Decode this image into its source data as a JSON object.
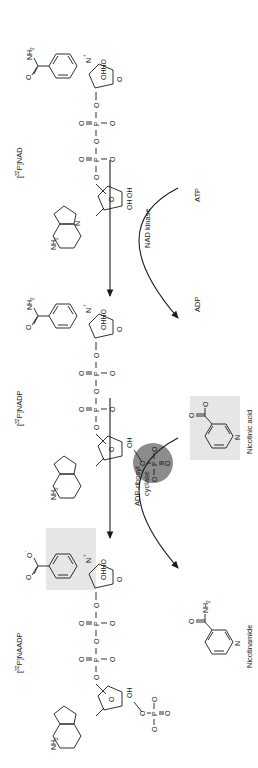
{
  "figure": {
    "orientation": "rotated-90-ccw",
    "colors": {
      "ink": "#1a1a1a",
      "highlight_box": "#e6e6e6",
      "phosphate_circle": "#8c8c8c",
      "background": "#ffffff"
    },
    "compounds": [
      {
        "id": "nad",
        "label_prefix": "[",
        "label_sup": "32",
        "label_suffix": "P]NAD"
      },
      {
        "id": "nadp",
        "label_prefix": "[",
        "label_sup": "32",
        "label_suffix": "P]NADP"
      },
      {
        "id": "naadp",
        "label_prefix": "[",
        "label_sup": "32",
        "label_suffix": "P]NAADP"
      }
    ],
    "reactions": [
      {
        "enzyme": "NAD kinase",
        "substrate_in": "ATP",
        "product_out": "ADP"
      },
      {
        "enzyme_line1": "ADP-ribosyl",
        "enzyme_line2": "cyclase",
        "substrate_in": "Nicotinic acid",
        "product_out": "Nicotinamide"
      }
    ],
    "atoms": {
      "N": "N",
      "Nplus": "N",
      "plus": "+",
      "O": "O",
      "Ominus": "O",
      "minus": "-",
      "P": "P",
      "OH": "OH",
      "HO": "HO",
      "NH": "NH",
      "two": "2",
      "OHHO": "OHHO"
    }
  }
}
